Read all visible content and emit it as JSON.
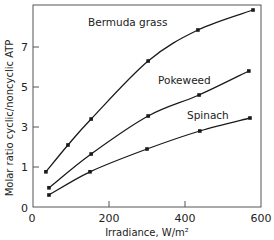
{
  "chart_data": {
    "type": "line",
    "title": "",
    "xlabel": "Irradiance, W/m²",
    "ylabel": "Molar ratio cyclic/noncyclic ATP",
    "xlim": [
      0,
      600
    ],
    "ylim": [
      0,
      9
    ],
    "x_ticks": [
      0,
      200,
      400,
      600
    ],
    "x_tick_labels": [
      "0",
      "200",
      "400",
      "600"
    ],
    "y_ticks": [
      0,
      1,
      3,
      5,
      7
    ],
    "y_tick_labels": [
      "0",
      "1",
      "3",
      "5",
      "7"
    ],
    "grid": false,
    "legend": "inline labels",
    "series": [
      {
        "name": "Bermuda grass",
        "x": [
          34,
          92,
          153,
          303,
          434,
          579
        ],
        "values": [
          0.88,
          2.1,
          3.4,
          6.3,
          7.85,
          8.85
        ],
        "label_pos": [
          88,
          26
        ]
      },
      {
        "name": "Pokeweed",
        "x": [
          42,
          153,
          303,
          437,
          568
        ],
        "values": [
          0.48,
          1.65,
          3.55,
          4.6,
          5.8
        ],
        "label_pos": [
          158,
          84
        ]
      },
      {
        "name": "Spinach",
        "x": [
          42,
          150,
          300,
          439,
          571
        ],
        "values": [
          0.3,
          0.88,
          1.9,
          2.8,
          3.45
        ],
        "label_pos": [
          187,
          119
        ]
      }
    ]
  },
  "colors": {
    "line": "#1a1a1a",
    "axis": "#555555",
    "background": "#ffffff"
  }
}
